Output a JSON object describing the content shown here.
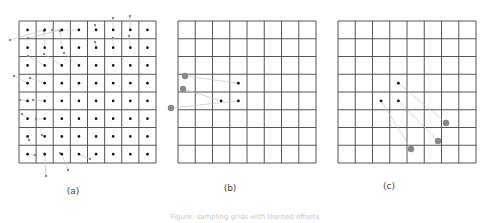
{
  "figure": {
    "caption": "Figure: sampling grids with learned offsets",
    "colors": {
      "grid_line": "#555555",
      "grid_dot": "#111111",
      "offset_point": "#888888",
      "offset_line": "#c4c4c4",
      "label": "#444444"
    },
    "grid": {
      "rows": 8,
      "cols": 8
    },
    "panels": [
      {
        "id": "a",
        "label": "(a)",
        "frame": {
          "x": 19,
          "y": 21,
          "w": 137,
          "h": 142
        },
        "label_pos": {
          "x": 73,
          "y": 194
        },
        "show_all_grid_dots": true,
        "offsets": [
          [
            [
              1,
              0
            ],
            [
              10,
              40
            ]
          ],
          [
            [
              2,
              0
            ],
            [
              28,
              38
            ]
          ],
          [
            [
              3,
              0
            ],
            [
              52,
              30
            ]
          ],
          [
            [
              4,
              0
            ],
            [
              95,
              25
            ]
          ],
          [
            [
              5,
              0
            ],
            [
              113,
              18
            ]
          ],
          [
            [
              6,
              0
            ],
            [
              130,
              16
            ]
          ],
          [
            [
              1,
              1
            ],
            [
              44,
              31
            ]
          ],
          [
            [
              2,
              1
            ],
            [
              60,
              31
            ]
          ],
          [
            [
              4,
              1
            ],
            [
              95,
              42
            ]
          ],
          [
            [
              5,
              1
            ],
            [
              113,
              38
            ]
          ],
          [
            [
              6,
              1
            ],
            [
              129,
              36
            ]
          ],
          [
            [
              1,
              2
            ],
            [
              28,
              56
            ]
          ],
          [
            [
              2,
              2
            ],
            [
              44,
              54
            ]
          ],
          [
            [
              3,
              2
            ],
            [
              64,
              53
            ]
          ],
          [
            [
              0,
              3
            ],
            [
              14,
              76
            ]
          ],
          [
            [
              1,
              3
            ],
            [
              30,
              78
            ]
          ],
          [
            [
              0,
              4
            ],
            [
              20,
              100
            ]
          ],
          [
            [
              1,
              4
            ],
            [
              33,
              100
            ]
          ],
          [
            [
              0,
              5
            ],
            [
              22,
              114
            ]
          ],
          [
            [
              1,
              5
            ],
            [
              36,
              119
            ]
          ],
          [
            [
              0,
              6
            ],
            [
              29,
              140
            ]
          ],
          [
            [
              1,
              6
            ],
            [
              42,
              135
            ]
          ],
          [
            [
              0,
              7
            ],
            [
              35,
              155
            ]
          ],
          [
            [
              2,
              7
            ],
            [
              60,
              153
            ]
          ],
          [
            [
              3,
              7
            ],
            [
              90,
              159
            ]
          ],
          [
            [
              1,
              7
            ],
            [
              46,
              176
            ]
          ],
          [
            [
              2,
              7
            ],
            [
              68,
              170
            ]
          ]
        ]
      },
      {
        "id": "b",
        "label": "(b)",
        "frame": {
          "x": 178,
          "y": 21,
          "w": 138,
          "h": 142
        },
        "label_pos": {
          "x": 230,
          "y": 191
        },
        "active_points": [
          [
            3,
            3
          ],
          [
            2,
            4
          ],
          [
            3,
            4
          ]
        ],
        "offsets": [
          [
            [
              3,
              3
            ],
            [
              185,
              76
            ]
          ],
          [
            [
              2,
              4
            ],
            [
              183,
              89
            ]
          ],
          [
            [
              3,
              4
            ],
            [
              171,
              108
            ]
          ]
        ]
      },
      {
        "id": "c",
        "label": "(c)",
        "frame": {
          "x": 338,
          "y": 21,
          "w": 138,
          "h": 142
        },
        "label_pos": {
          "x": 389,
          "y": 189
        },
        "active_points": [
          [
            3,
            3
          ],
          [
            2,
            4
          ],
          [
            3,
            4
          ]
        ],
        "offsets": [
          [
            [
              3,
              3
            ],
            [
              446,
              123
            ]
          ],
          [
            [
              3,
              4
            ],
            [
              438,
              141
            ]
          ],
          [
            [
              2,
              4
            ],
            [
              411,
              149
            ]
          ]
        ]
      }
    ]
  }
}
